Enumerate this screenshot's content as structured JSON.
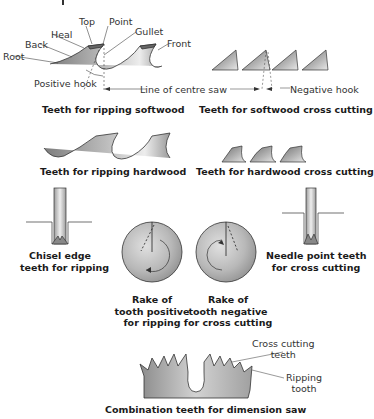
{
  "figure": {
    "panels": [
      {
        "id": "ripping-softwood",
        "caption": "Teeth for ripping softwood",
        "labels": [
          "Root",
          "Back",
          "Heal",
          "Top",
          "Point",
          "Gullet",
          "Front",
          "Positive hook"
        ]
      },
      {
        "id": "softwood-cross-cutting",
        "caption": "Teeth for softwood cross cutting",
        "labels": [
          "Negative hook"
        ]
      },
      {
        "id": "ripping-hardwood",
        "caption": "Teeth for ripping hardwood"
      },
      {
        "id": "hardwood-cross-cutting",
        "caption": "Teeth for hardwood cross cutting"
      },
      {
        "id": "chisel-edge",
        "caption_lines": [
          "Chisel edge",
          "teeth for ripping"
        ]
      },
      {
        "id": "rake-positive",
        "caption_lines": [
          "Rake of",
          "tooth positive",
          "for ripping"
        ]
      },
      {
        "id": "rake-negative",
        "caption_lines": [
          "Rake of",
          "tooth negative",
          "for cross cutting"
        ]
      },
      {
        "id": "needle-point",
        "caption_lines": [
          "Needle point teeth",
          "for cross cutting"
        ]
      },
      {
        "id": "combination",
        "caption": "Combination teeth for dimension saw",
        "labels": {
          "cross_cutting": [
            "Cross cutting",
            "teeth"
          ],
          "ripping": [
            "Ripping",
            "tooth"
          ]
        }
      }
    ],
    "shared_labels": {
      "centre_line": "Line of centre saw"
    }
  },
  "colors": {
    "line": "#333333",
    "fill_dark": "#8a8a8a",
    "fill_light": "#e6e6e6",
    "text": "#222222"
  }
}
